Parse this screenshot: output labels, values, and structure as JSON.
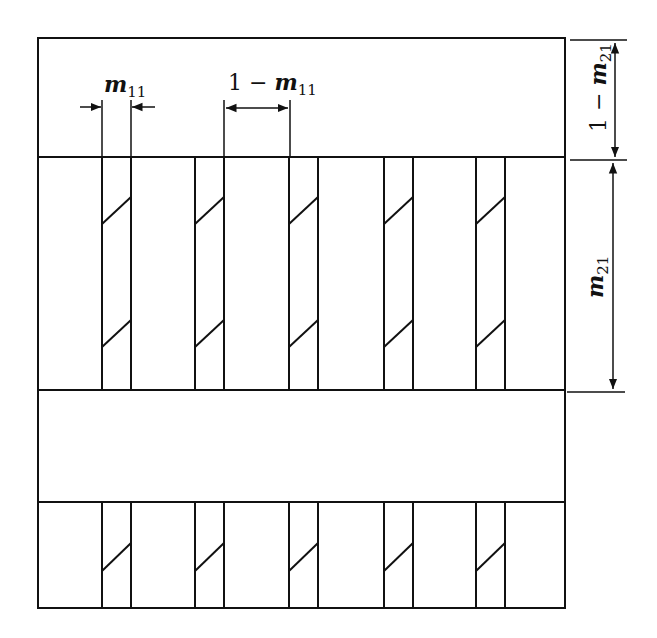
{
  "diagram": {
    "title": "",
    "colors": {
      "line": "#111111",
      "background": "#ffffff"
    },
    "frame": {
      "x": 38,
      "y": 38,
      "width": 527,
      "height": 570
    },
    "bands": [
      {
        "name": "top-gap",
        "y0": 38,
        "y1": 157,
        "strips": false
      },
      {
        "name": "middle-strip-band",
        "y0": 157,
        "y1": 390,
        "strips": true,
        "diagonals": 2
      },
      {
        "name": "lower-gap",
        "y0": 390,
        "y1": 502,
        "strips": false
      },
      {
        "name": "bottom-strip-band",
        "y0": 502,
        "y1": 608,
        "strips": true,
        "diagonals": 1
      }
    ],
    "strips": [
      {
        "x0": 102,
        "x1": 131
      },
      {
        "x0": 195,
        "x1": 224
      },
      {
        "x0": 289,
        "x1": 318
      },
      {
        "x0": 384,
        "x1": 413
      },
      {
        "x0": 476,
        "x1": 505
      }
    ],
    "labels": {
      "m11": {
        "base": "m",
        "sub": "11"
      },
      "one_minus_m11": {
        "prefix": "1 − ",
        "base": "m",
        "sub": "11"
      },
      "one_minus_m21": {
        "prefix": "1 − ",
        "base": "m",
        "sub": "21"
      },
      "m21": {
        "base": "m",
        "sub": "21"
      }
    },
    "dimensions": [
      {
        "name": "strip-width",
        "label": "m11",
        "orientation": "horizontal",
        "from": 102,
        "to": 131,
        "style": "arrows-inward"
      },
      {
        "name": "strip-gap",
        "label": "1 − m11",
        "orientation": "horizontal",
        "from": 224,
        "to": 289,
        "style": "arrows-outward"
      },
      {
        "name": "top-gap-height",
        "label": "1 − m21",
        "orientation": "vertical",
        "from": 38,
        "to": 157
      },
      {
        "name": "strip-band-height",
        "label": "m21",
        "orientation": "vertical",
        "from": 157,
        "to": 390
      }
    ]
  }
}
